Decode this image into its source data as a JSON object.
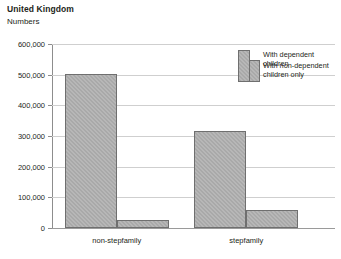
{
  "chart_data": {
    "type": "bar",
    "title": "United Kingdom",
    "subtitle": "Numbers",
    "xlabel": "",
    "ylabel": "",
    "categories": [
      "non-stepfamily",
      "stepfamily"
    ],
    "series": [
      {
        "name": "With dependent children",
        "values": [
          503000,
          315000
        ]
      },
      {
        "name": "With non-dependent children only",
        "values": [
          26000,
          60000
        ]
      }
    ],
    "ylim": [
      0,
      600000
    ],
    "ytick_values": [
      0,
      100000,
      200000,
      300000,
      400000,
      500000,
      600000
    ],
    "ytick_labels": [
      "0",
      "100,000",
      "200,000",
      "300,000",
      "400,000",
      "500,000",
      "600,000"
    ],
    "grid": true,
    "legend_position": "top-right",
    "bar_fill_color": "#a9a9a9",
    "bar_border_color": "#6f6f6f",
    "gridline_color": "#cfcfcf",
    "axis_color": "#8d8d8d",
    "text_color": "#231f20",
    "background_color": "#ffffff"
  }
}
